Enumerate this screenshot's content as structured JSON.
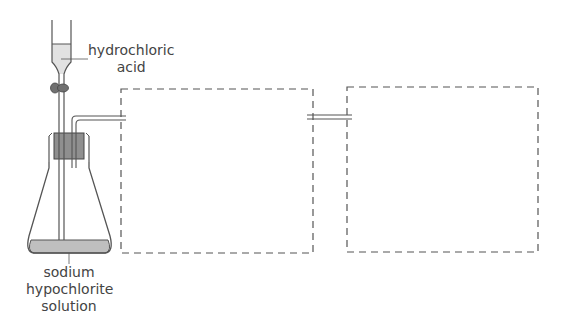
{
  "figure": {
    "labels": {
      "acid_line1": "hydrochloric",
      "acid_line2": "acid",
      "solution_line1": "sodium",
      "solution_line2": "hypochlorite",
      "solution_line3": "solution"
    },
    "colors": {
      "stroke": "#555555",
      "liquid": "#bfbfbf",
      "stopper": "#8f8f8f",
      "tap": "#707070",
      "dash": "#555555"
    },
    "components": [
      "dropping funnel",
      "tap",
      "rubber bung",
      "conical flask",
      "delivery tube",
      "dashed box 1",
      "connecting tube",
      "dashed box 2"
    ]
  }
}
